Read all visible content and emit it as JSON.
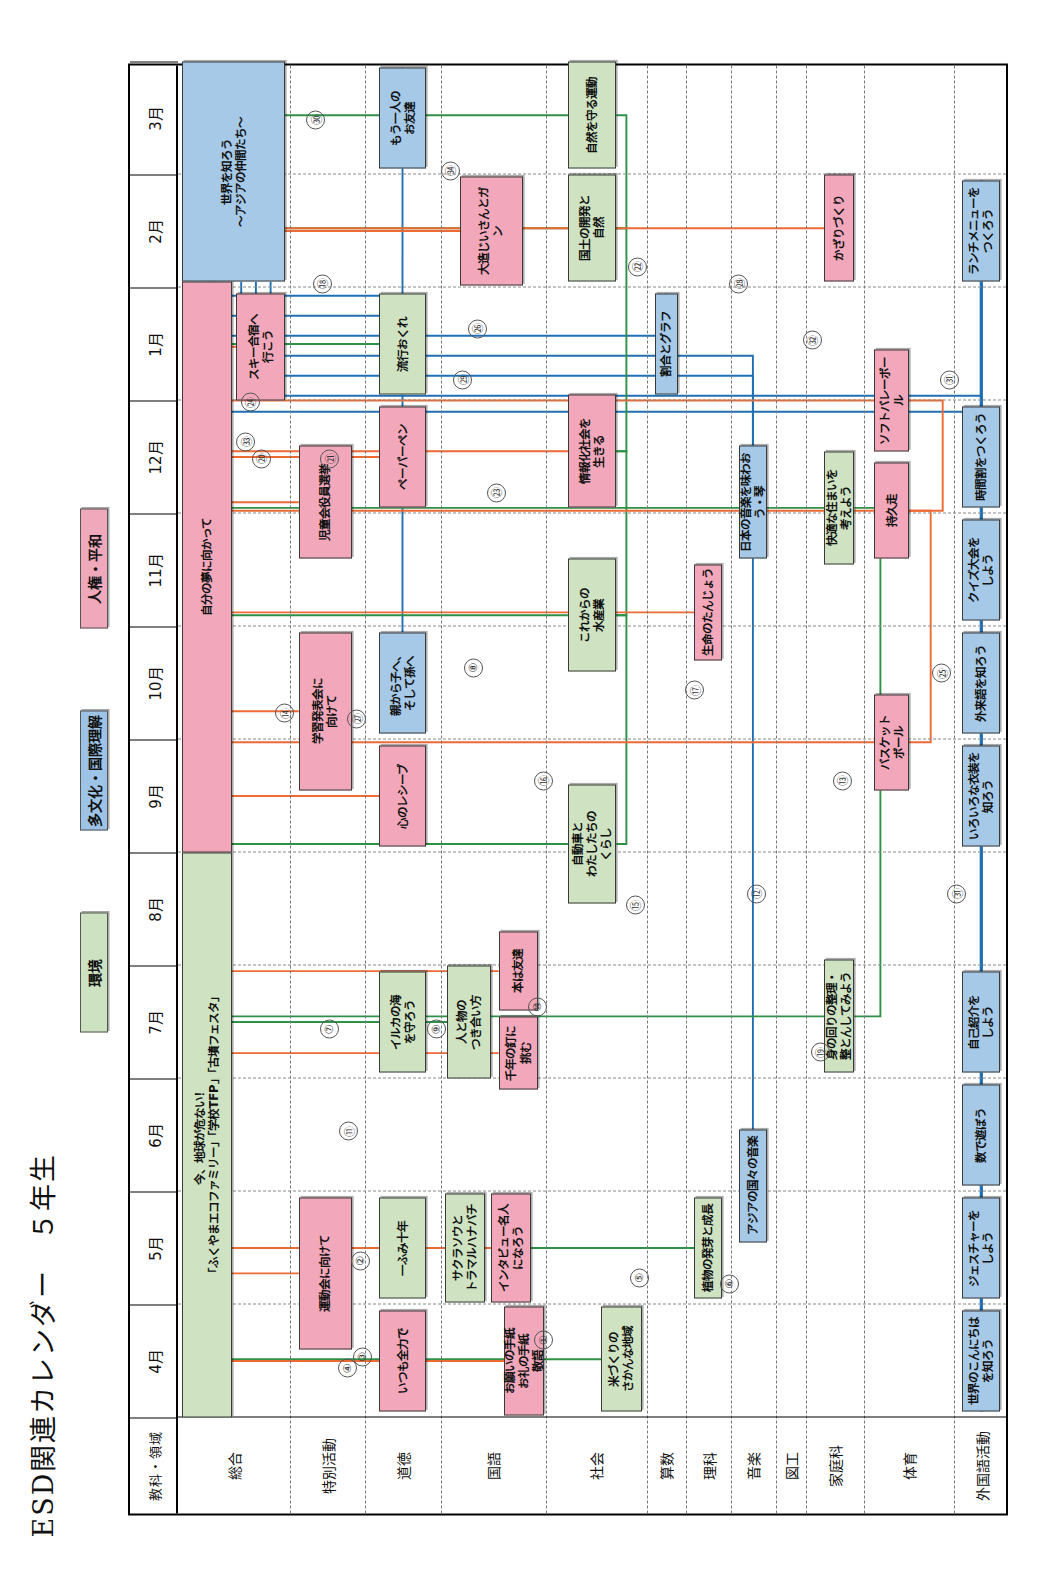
{
  "title": "ESD関連カレンダー　５年生",
  "legend": [
    {
      "label": "環境",
      "color": "#cde2c0",
      "key": "env"
    },
    {
      "label": "多文化・国際理解",
      "color": "#9dc3e6",
      "key": "multi"
    },
    {
      "label": "人権・平和",
      "color": "#f0a9bb",
      "key": "peace"
    }
  ],
  "header": {
    "corner": "教科・領域",
    "months": [
      "4月",
      "5月",
      "6月",
      "7月",
      "8月",
      "9月",
      "10月",
      "11月",
      "12月",
      "1月",
      "2月",
      "3月"
    ]
  },
  "rows": [
    {
      "label": "総合"
    },
    {
      "label": "特別活動"
    },
    {
      "label": "道徳"
    },
    {
      "label": "国語"
    },
    {
      "label": "社会"
    },
    {
      "label": "算数"
    },
    {
      "label": "理科"
    },
    {
      "label": "音楽"
    },
    {
      "label": "図工"
    },
    {
      "label": "家庭科"
    },
    {
      "label": "体育"
    },
    {
      "label": "外国語活動"
    }
  ],
  "items": [
    {
      "row": "総合",
      "text": "今、地球が危ない！\n「ふくやまエコファミリー」「学校TFP」「古墳フェスタ」",
      "type": "env"
    },
    {
      "row": "総合",
      "text": "自分の夢に向かって",
      "type": "peace"
    },
    {
      "row": "総合",
      "text": "スキー合宿へ\n行こう",
      "type": "peace"
    },
    {
      "row": "総合",
      "text": "世界を知ろう\n～アジアの仲間たち～",
      "type": "multi"
    },
    {
      "row": "特別活動",
      "text": "運動会に向けて",
      "type": "peace"
    },
    {
      "row": "特別活動",
      "text": "学習発表会に\n向けて",
      "type": "peace"
    },
    {
      "row": "特別活動",
      "text": "児童会役員選挙",
      "type": "peace"
    },
    {
      "row": "道徳",
      "text": "いつも全力で",
      "type": "peace"
    },
    {
      "row": "道徳",
      "text": "一ふみ十年",
      "type": "env"
    },
    {
      "row": "道徳",
      "text": "イルカの海\nを守ろう",
      "type": "env"
    },
    {
      "row": "道徳",
      "text": "心のレシーブ",
      "type": "peace"
    },
    {
      "row": "道徳",
      "text": "親から子へ、\nそして孫へ",
      "type": "multi"
    },
    {
      "row": "道徳",
      "text": "ペーパーペン",
      "type": "peace"
    },
    {
      "row": "道徳",
      "text": "流行おくれ",
      "type": "env"
    },
    {
      "row": "道徳",
      "text": "もう一人の\nお友達",
      "type": "multi"
    },
    {
      "row": "国語",
      "text": "お願いの手紙\nお礼の手紙\n敬語",
      "type": "peace"
    },
    {
      "row": "国語",
      "text": "インタビュー名人\nになろう",
      "type": "peace"
    },
    {
      "row": "国語",
      "text": "サクラソウと\nトラマルハナバチ",
      "type": "env"
    },
    {
      "row": "国語",
      "text": "千年の釘に\n挑む",
      "type": "peace"
    },
    {
      "row": "国語",
      "text": "本は友達",
      "type": "peace"
    },
    {
      "row": "国語",
      "text": "人と物の\nつき合い方",
      "type": "env"
    },
    {
      "row": "国語",
      "text": "大造じいさんとガ\nン",
      "type": "peace"
    },
    {
      "row": "社会",
      "text": "米づくりの\nさかんな地域",
      "type": "env"
    },
    {
      "row": "社会",
      "text": "自動車と\nわたしたちの\nくらし",
      "type": "env"
    },
    {
      "row": "社会",
      "text": "これからの\n水産業",
      "type": "env"
    },
    {
      "row": "社会",
      "text": "情報化社会を\n生きる",
      "type": "peace"
    },
    {
      "row": "社会",
      "text": "国土の開発と\n自然",
      "type": "env"
    },
    {
      "row": "社会",
      "text": "自然を守る運動",
      "type": "env"
    },
    {
      "row": "算数",
      "text": "割合とグラフ",
      "type": "multi"
    },
    {
      "row": "理科",
      "text": "植物の発芽と成長",
      "type": "env"
    },
    {
      "row": "理科",
      "text": "生命のたんじょう",
      "type": "peace"
    },
    {
      "row": "音楽",
      "text": "アジアの国々の音楽",
      "type": "multi"
    },
    {
      "row": "音楽",
      "text": "日本の音楽を味わおう・琴",
      "type": "multi"
    },
    {
      "row": "家庭科",
      "text": "身の回りの整理・\n整とんしてみよう",
      "type": "env"
    },
    {
      "row": "家庭科",
      "text": "快適な住まいを\n考えよう",
      "type": "env"
    },
    {
      "row": "家庭科",
      "text": "かざりづくり",
      "type": "peace"
    },
    {
      "row": "体育",
      "text": "バスケット\nボール",
      "type": "peace"
    },
    {
      "row": "体育",
      "text": "持久走",
      "type": "peace"
    },
    {
      "row": "体育",
      "text": "ソフトバレーボール",
      "type": "peace"
    },
    {
      "row": "外国語活動",
      "text": "世界のこんにちは\nを知ろう",
      "type": "multi"
    },
    {
      "row": "外国語活動",
      "text": "ジェスチャーを\nしよう",
      "type": "multi"
    },
    {
      "row": "外国語活動",
      "text": "数で遊ぼう",
      "type": "multi"
    },
    {
      "row": "外国語活動",
      "text": "自己紹介を\nしよう",
      "type": "multi"
    },
    {
      "row": "外国語活動",
      "text": "いろいろな衣装を\n知ろう",
      "type": "multi"
    },
    {
      "row": "外国語活動",
      "text": "外来語を知ろう",
      "type": "multi"
    },
    {
      "row": "外国語活動",
      "text": "クイズ大会を\nしよう",
      "type": "multi"
    },
    {
      "row": "外国語活動",
      "text": "時間割をつくろう",
      "type": "multi"
    },
    {
      "row": "外国語活動",
      "text": "ランチメニューを\nつくろう",
      "type": "multi"
    }
  ],
  "connector_numbers": [
    "①",
    "②",
    "③",
    "④",
    "⑤",
    "⑥",
    "⑦",
    "⑧",
    "⑨",
    "⑩",
    "⑪",
    "⑫",
    "⑬",
    "⑭",
    "⑮",
    "⑯",
    "⑰",
    "⑱",
    "⑲",
    "⑳",
    "㉑",
    "㉒",
    "㉓",
    "㉔",
    "㉕",
    "㉖",
    "㉗",
    "㉘",
    "㉙",
    "㉚",
    "㉛",
    "㉜",
    "㉝",
    "㉞"
  ],
  "colors": {
    "env_line": "#2e9148",
    "multi_line": "#1f6fb4",
    "peace_line": "#ee6a35",
    "env_fill": "#cfe3c2",
    "multi_fill": "#a6c9e8",
    "peace_fill": "#f2a8ba",
    "border": "#3a3a3a"
  }
}
